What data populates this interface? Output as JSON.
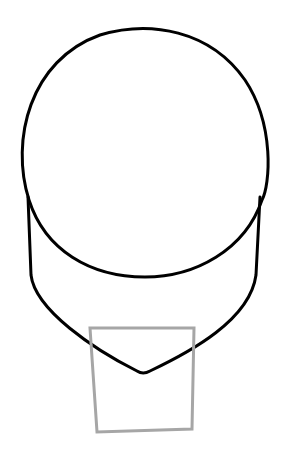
{
  "canvas": {
    "width": 283,
    "height": 458,
    "background": "#ffffff"
  },
  "drawing": {
    "subject": "head outline sketch",
    "stroke_color": "#000000",
    "selection_box_color": "#a6a6a6",
    "elements": [
      {
        "name": "cranium-circle",
        "type": "ellipse"
      },
      {
        "name": "jaw-outline",
        "type": "path"
      },
      {
        "name": "selection-box",
        "type": "polygon"
      }
    ]
  }
}
